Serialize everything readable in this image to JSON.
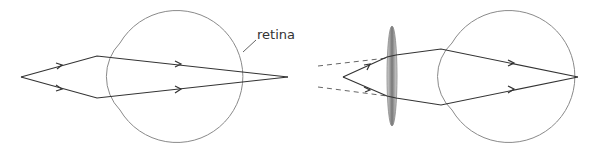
{
  "diagram": {
    "labels": {
      "retina": "retina"
    },
    "colors": {
      "ray": "#333333",
      "outline": "#8a8a8a",
      "dashed": "#666666",
      "lens_dark": "#5a5a5a",
      "lens_light": "#d8d8d8"
    },
    "left_panel": {
      "object_point": [
        21,
        77
      ],
      "focus_point": [
        288,
        77
      ],
      "description": "Rays from near point focus behind retina"
    },
    "right_panel": {
      "object_point": [
        343,
        77
      ],
      "focus_point": [
        578,
        77
      ],
      "lens": "converging lens",
      "description": "Converging lens brings focus onto retina"
    }
  }
}
